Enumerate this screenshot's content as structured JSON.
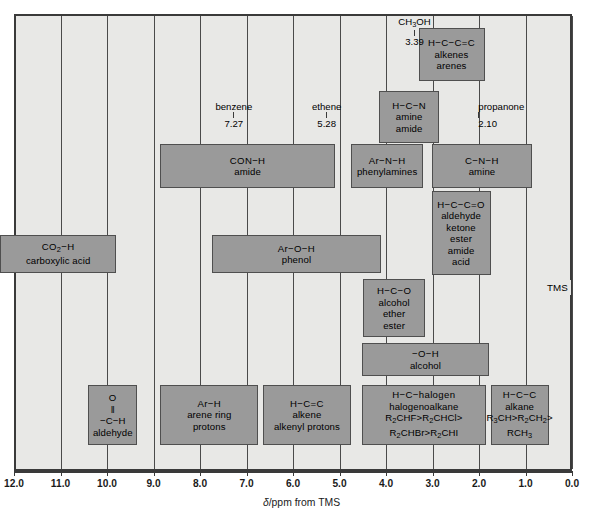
{
  "chart_data": {
    "type": "bar",
    "title": "",
    "xlabel": "δ/ppm from TMS",
    "ylabel": "",
    "xlim": [
      12.0,
      0.0
    ],
    "grid": true,
    "legend": "none",
    "tick_labels": [
      "12.0",
      "11.0",
      "10.0",
      "9.0",
      "8.0",
      "7.0",
      "6.0",
      "5.0",
      "4.0",
      "3.0",
      "2.0",
      "1.0",
      "0.0"
    ],
    "ticks": [
      12.0,
      11.0,
      10.0,
      9.0,
      8.0,
      7.0,
      6.0,
      5.0,
      4.0,
      3.0,
      2.0,
      1.0,
      0.0
    ],
    "ranges": [
      {
        "id": "co2h",
        "lines": [
          "CO<sub>2</sub>−H",
          "carboxylic acid"
        ],
        "x_start": 12.0,
        "x_end": 9.5,
        "row": 0
      },
      {
        "id": "conh",
        "lines": [
          "CON−H",
          "amide"
        ],
        "x_start": 8.55,
        "x_end": 4.8,
        "row": 1
      },
      {
        "id": "arnh",
        "lines": [
          "Ar−N−H",
          "phenylamines"
        ],
        "x_start": 4.45,
        "x_end": 2.9,
        "row": 1
      },
      {
        "id": "cnh",
        "lines": [
          "C−N−H",
          "amine"
        ],
        "x_start": 2.72,
        "x_end": 0.55,
        "row": 1
      },
      {
        "id": "aroh",
        "lines": [
          "Ar−O−H",
          "phenol"
        ],
        "x_start": 7.45,
        "x_end": 3.8,
        "row": 0
      },
      {
        "id": "hcn",
        "lines": [
          "H−C−N",
          "amine",
          "amide"
        ],
        "x_start": 3.85,
        "x_end": 2.55,
        "row": 2
      },
      {
        "id": "hcceqc",
        "lines": [
          "H−C−C=C",
          "alkenes",
          "arenes"
        ],
        "x_start": 3.0,
        "x_end": 1.58,
        "row": 3
      },
      {
        "id": "hcceqo",
        "lines": [
          "H−C−C=O",
          "aldehyde",
          "ketone",
          "ester",
          "amide",
          "acid"
        ],
        "x_start": 2.72,
        "x_end": 1.45,
        "row": 4
      },
      {
        "id": "hco",
        "lines": [
          "H−C−O",
          "alcohol",
          "ether",
          "ester"
        ],
        "x_start": 4.2,
        "x_end": 2.85,
        "row": 5
      },
      {
        "id": "ooh",
        "lines": [
          "−O−H",
          "alcohol"
        ],
        "x_start": 4.22,
        "x_end": 1.48,
        "row": 6
      },
      {
        "id": "aldehyde",
        "lines": [
          "O",
          "‖",
          "−C−H",
          "aldehyde"
        ],
        "x_start": 10.1,
        "x_end": 9.05,
        "row": 7
      },
      {
        "id": "arh",
        "lines": [
          "Ar−H",
          "arene ring",
          "protons"
        ],
        "x_start": 8.55,
        "x_end": 6.45,
        "row": 7
      },
      {
        "id": "hceqc",
        "lines": [
          "H−C=C",
          "alkene",
          "alkenyl protons"
        ],
        "x_start": 6.35,
        "x_end": 4.45,
        "row": 7
      },
      {
        "id": "halogen",
        "lines": [
          "H−C−halogen",
          "halogenoalkane",
          "R<sub>2</sub>CHF>R<sub>2</sub>CHCl>",
          "R<sub>2</sub>CHBr>R<sub>2</sub>CHI"
        ],
        "x_start": 4.22,
        "x_end": 1.55,
        "row": 7
      },
      {
        "id": "alkane",
        "lines": [
          "H−C−C",
          "alkane",
          "R<sub>3</sub>CH>R<sub>2</sub>CH<sub>2</sub>>",
          "RCH<sub>3</sub>"
        ],
        "x_start": 1.45,
        "x_end": 0.2,
        "row": 7
      }
    ],
    "reference_markers": [
      {
        "id": "ch3oh",
        "label": "CH<sub>3</sub>OH",
        "value": "3.39",
        "x": 3.39
      },
      {
        "id": "benzene",
        "label": "benzene",
        "value": "7.27",
        "x": 7.27
      },
      {
        "id": "ethene",
        "label": "ethene",
        "value": "5.28",
        "x": 5.28
      },
      {
        "id": "propanone",
        "label": "propanone",
        "value": "2.10",
        "x": 2.1
      },
      {
        "id": "tms",
        "label": "TMS",
        "value": "0.00",
        "x": 0.0
      }
    ]
  },
  "axis": {
    "labels": [
      "12.0",
      "11.0",
      "10.0",
      "9.0",
      "8.0",
      "7.0",
      "6.0",
      "5.0",
      "4.0",
      "3.0",
      "2.0",
      "1.0",
      "0.0"
    ],
    "title_symbol": "δ",
    "title_rest": "/ppm from TMS"
  },
  "markers": {
    "ch3oh": {
      "name": "CH3OH",
      "value": "3.39"
    },
    "benzene": {
      "name": "benzene",
      "value": "7.27"
    },
    "ethene": {
      "name": "ethene",
      "value": "5.28"
    },
    "propanone": {
      "name": "propanone",
      "value": "2.10"
    },
    "tms": {
      "name": "TMS"
    }
  },
  "colors": {
    "plot_background": "#e8e8e6",
    "box_fill": "#9a9a9a",
    "box_border": "#4f4f4f",
    "gridline": "#4a4a4a",
    "frame": "#3a3a3a",
    "text": "#000000"
  }
}
